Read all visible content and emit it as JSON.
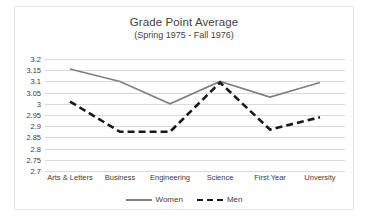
{
  "chart_data": {
    "type": "line",
    "title": "Grade Point Average",
    "subtitle": "(Spring 1975 - Fall 1976)",
    "xlabel": "",
    "ylabel": "",
    "ylim": [
      2.7,
      3.2
    ],
    "yticks": [
      "3.2",
      "3.15",
      "3.1",
      "3.05",
      "3",
      "2.95",
      "2.9",
      "2.85",
      "2.8",
      "2.75",
      "2.7"
    ],
    "ytick_values": [
      3.2,
      3.15,
      3.1,
      3.05,
      3.0,
      2.95,
      2.9,
      2.85,
      2.8,
      2.75,
      2.7
    ],
    "grid": true,
    "legend_position": "bottom",
    "categories": [
      "Arts & Letters",
      "Business",
      "Engineering",
      "Science",
      "First Year",
      "Unversity"
    ],
    "series": [
      {
        "name": "Women",
        "color": "#808080",
        "style": "solid",
        "values": [
          3.155,
          3.1,
          3.0,
          3.1,
          3.03,
          3.095
        ]
      },
      {
        "name": "Men",
        "color": "#1a1a1a",
        "style": "dashed",
        "values": [
          3.01,
          2.875,
          2.875,
          3.095,
          2.885,
          2.94
        ]
      }
    ]
  },
  "legend": {
    "items": [
      {
        "label": "Women",
        "icon": "solid-line-swatch"
      },
      {
        "label": "Men",
        "icon": "dashed-line-swatch"
      }
    ]
  }
}
